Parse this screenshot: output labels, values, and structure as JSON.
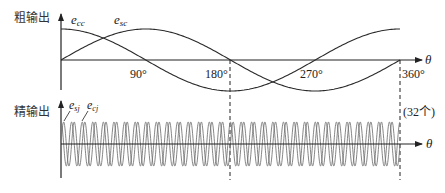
{
  "coarse": {
    "label": "粗输出",
    "series": [
      {
        "name": "e_cc",
        "base": "e",
        "sub": "cc",
        "fn": "cos"
      },
      {
        "name": "e_sc",
        "base": "e",
        "sub": "sc",
        "fn": "sin"
      }
    ],
    "ticks": [
      "90°",
      "180°",
      "270°",
      "360°"
    ],
    "axis_label": "θ"
  },
  "fine": {
    "label": "精输出",
    "series": [
      {
        "name": "e_sj",
        "base": "e",
        "sub": "sj",
        "fn": "sin"
      },
      {
        "name": "e_cj",
        "base": "e",
        "sub": "cj",
        "fn": "cos"
      }
    ],
    "cycles_note": "(32个)",
    "axis_label": "θ"
  },
  "chart_data": [
    {
      "type": "line",
      "title": "粗输出",
      "xlabel": "θ",
      "x_ticks": [
        90,
        180,
        270,
        360
      ],
      "xlim": [
        0,
        360
      ],
      "series": [
        {
          "name": "e_cc",
          "function": "cos(θ)",
          "cycles": 1
        },
        {
          "name": "e_sc",
          "function": "sin(θ)",
          "cycles": 1
        }
      ]
    },
    {
      "type": "line",
      "title": "精输出",
      "xlabel": "θ",
      "xlim": [
        0,
        360
      ],
      "annotation": "(32个)",
      "series": [
        {
          "name": "e_sj",
          "function": "sin(32θ)",
          "cycles": 32
        },
        {
          "name": "e_cj",
          "function": "cos(32θ)",
          "cycles": 32
        }
      ]
    }
  ],
  "colors": {
    "coarse_curve": "#2b2b2b",
    "fine_curve": "#777777",
    "axis": "#222222"
  }
}
